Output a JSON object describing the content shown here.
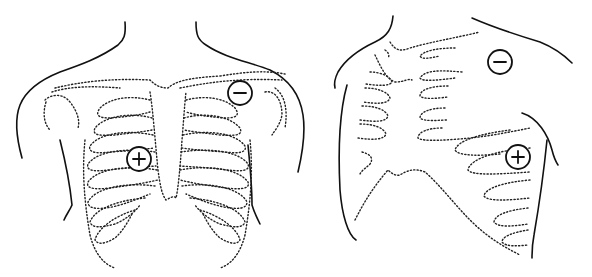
{
  "figure": {
    "panels": [
      {
        "id": "anterior-view",
        "electrodes": [
          {
            "polarity": "negative",
            "symbol": "−",
            "cx": 240,
            "cy": 93,
            "r": 12
          },
          {
            "polarity": "positive",
            "symbol": "+",
            "cx": 139,
            "cy": 159,
            "r": 12
          }
        ]
      },
      {
        "id": "lateral-view",
        "electrodes": [
          {
            "polarity": "negative",
            "symbol": "−",
            "cx": 500,
            "cy": 62,
            "r": 12
          },
          {
            "polarity": "positive",
            "symbol": "+",
            "cx": 518,
            "cy": 157,
            "r": 12
          }
        ]
      }
    ],
    "colors": {
      "line": "#111111",
      "background": "#ffffff"
    }
  }
}
